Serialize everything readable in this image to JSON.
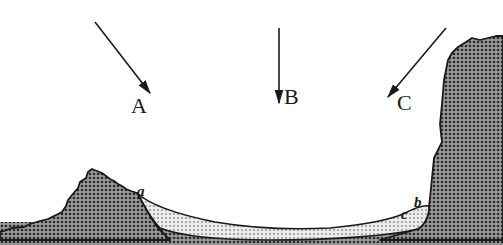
{
  "diagram": {
    "type": "landform cross-section with incident directions",
    "arrows": [
      {
        "id": "A",
        "label": "A",
        "x1": 95,
        "y1": 22,
        "x2": 150,
        "y2": 93,
        "label_x": 131,
        "label_y": 113
      },
      {
        "id": "B",
        "label": "B",
        "x1": 279,
        "y1": 28,
        "x2": 279,
        "y2": 103,
        "label_x": 284,
        "label_y": 104
      },
      {
        "id": "C",
        "label": "C",
        "x1": 446,
        "y1": 28,
        "x2": 388,
        "y2": 97,
        "label_x": 397,
        "label_y": 110
      }
    ],
    "points": [
      {
        "id": "a",
        "label": "a",
        "x": 137,
        "y": 196
      },
      {
        "id": "b",
        "label": "b",
        "x": 414,
        "y": 207
      },
      {
        "id": "c",
        "label": "c",
        "x": 401,
        "y": 219
      }
    ],
    "colors": {
      "background": "#ffffff",
      "ink": "#1a1a1a",
      "rock_fill": "#8a8a8a",
      "sediment_fill": "#d9d9d9",
      "base_strip": "#b8b8b8"
    },
    "regions": [
      "left-hill",
      "right-cliff",
      "basin-sediment",
      "basin-floor"
    ]
  }
}
